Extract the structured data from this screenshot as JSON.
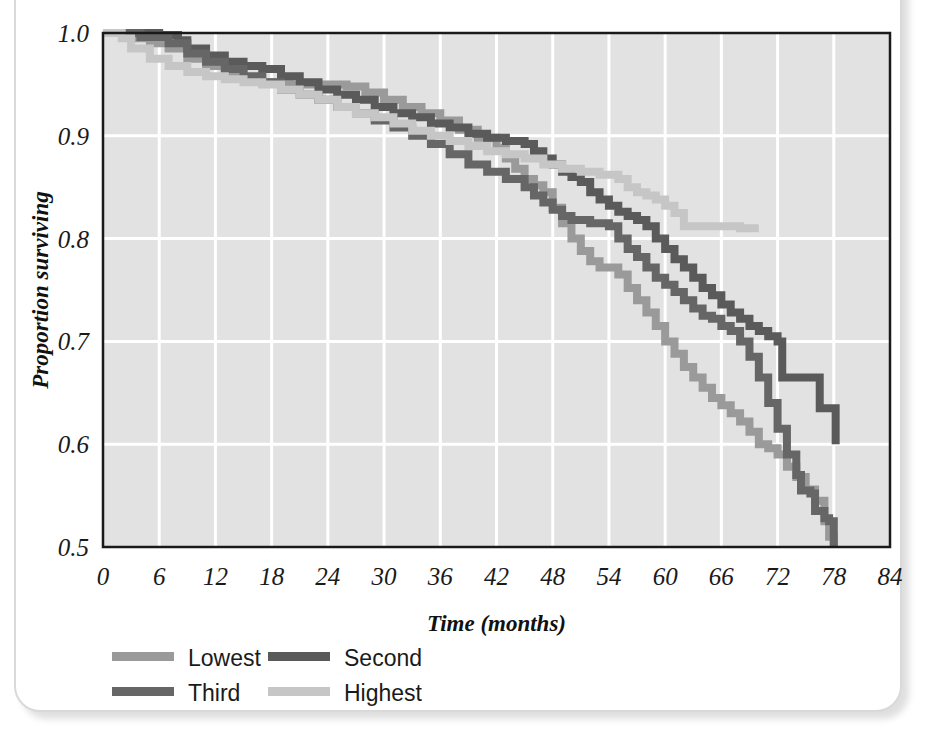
{
  "figure": {
    "cropped_caption_above": "",
    "frame_style": "rounded-box"
  },
  "chart_data": {
    "type": "line",
    "subtype": "kaplan-meier-step",
    "title": "",
    "xlabel": "Time (months)",
    "ylabel": "Proportion surviving",
    "xlim": [
      0,
      84
    ],
    "ylim": [
      0.5,
      1.0
    ],
    "xticks": [
      0,
      6,
      12,
      18,
      24,
      30,
      36,
      42,
      48,
      54,
      60,
      66,
      72,
      78,
      84
    ],
    "yticks": [
      0.5,
      0.6,
      0.7,
      0.8,
      0.9,
      1.0
    ],
    "xtick_labels": [
      "0",
      "6",
      "12",
      "18",
      "24",
      "30",
      "36",
      "42",
      "48",
      "54",
      "60",
      "66",
      "72",
      "78",
      "84"
    ],
    "ytick_labels": [
      "0.5",
      "0.6",
      "0.7",
      "0.8",
      "0.9",
      "1.0"
    ],
    "grid": true,
    "grid_color": "#ffffff",
    "plot_bg": "#e2e2e2",
    "legend_position": "below-axis-left",
    "series": [
      {
        "name": "Lowest",
        "color": "#9a9a9a",
        "points": [
          [
            0,
            1.0
          ],
          [
            3,
            0.995
          ],
          [
            5,
            0.99
          ],
          [
            7,
            0.985
          ],
          [
            9,
            0.975
          ],
          [
            11,
            0.968
          ],
          [
            13,
            0.962
          ],
          [
            15,
            0.956
          ],
          [
            17,
            0.952
          ],
          [
            20,
            0.95
          ],
          [
            23,
            0.95
          ],
          [
            26,
            0.948
          ],
          [
            28,
            0.942
          ],
          [
            30,
            0.935
          ],
          [
            32,
            0.928
          ],
          [
            34,
            0.922
          ],
          [
            36,
            0.915
          ],
          [
            38,
            0.906
          ],
          [
            40,
            0.898
          ],
          [
            42,
            0.888
          ],
          [
            43,
            0.878
          ],
          [
            44,
            0.868
          ],
          [
            45,
            0.858
          ],
          [
            46,
            0.852
          ],
          [
            47,
            0.845
          ],
          [
            48,
            0.83
          ],
          [
            49,
            0.815
          ],
          [
            50,
            0.8
          ],
          [
            51,
            0.788
          ],
          [
            52,
            0.778
          ],
          [
            53,
            0.772
          ],
          [
            55,
            0.765
          ],
          [
            56,
            0.752
          ],
          [
            57,
            0.74
          ],
          [
            58,
            0.728
          ],
          [
            59,
            0.715
          ],
          [
            60,
            0.7
          ],
          [
            61,
            0.688
          ],
          [
            62,
            0.675
          ],
          [
            63,
            0.665
          ],
          [
            64,
            0.655
          ],
          [
            65,
            0.645
          ],
          [
            66,
            0.638
          ],
          [
            67,
            0.63
          ],
          [
            68,
            0.622
          ],
          [
            69,
            0.612
          ],
          [
            70,
            0.6
          ],
          [
            71,
            0.596
          ],
          [
            72,
            0.59
          ],
          [
            73,
            0.578
          ],
          [
            74,
            0.568
          ],
          [
            75,
            0.556
          ],
          [
            76,
            0.545
          ],
          [
            77,
            0.525
          ],
          [
            77.5,
            0.51
          ],
          [
            78,
            0.5
          ]
        ]
      },
      {
        "name": "Second",
        "color": "#5a5a5a",
        "points": [
          [
            0,
            1.0
          ],
          [
            6,
            0.998
          ],
          [
            8,
            0.993
          ],
          [
            9,
            0.985
          ],
          [
            11,
            0.978
          ],
          [
            13,
            0.972
          ],
          [
            15,
            0.968
          ],
          [
            17,
            0.965
          ],
          [
            19,
            0.958
          ],
          [
            21,
            0.952
          ],
          [
            23,
            0.945
          ],
          [
            25,
            0.94
          ],
          [
            27,
            0.935
          ],
          [
            29,
            0.928
          ],
          [
            31,
            0.922
          ],
          [
            33,
            0.918
          ],
          [
            35,
            0.912
          ],
          [
            37,
            0.908
          ],
          [
            39,
            0.902
          ],
          [
            41,
            0.898
          ],
          [
            43,
            0.895
          ],
          [
            45,
            0.892
          ],
          [
            46,
            0.885
          ],
          [
            47,
            0.878
          ],
          [
            48,
            0.872
          ],
          [
            49,
            0.865
          ],
          [
            50,
            0.86
          ],
          [
            51,
            0.855
          ],
          [
            52,
            0.845
          ],
          [
            53,
            0.838
          ],
          [
            54,
            0.832
          ],
          [
            55,
            0.826
          ],
          [
            56,
            0.822
          ],
          [
            57,
            0.818
          ],
          [
            58,
            0.812
          ],
          [
            59,
            0.8
          ],
          [
            60,
            0.79
          ],
          [
            61,
            0.78
          ],
          [
            62,
            0.772
          ],
          [
            63,
            0.762
          ],
          [
            64,
            0.752
          ],
          [
            65,
            0.745
          ],
          [
            66,
            0.736
          ],
          [
            67,
            0.728
          ],
          [
            68,
            0.722
          ],
          [
            69,
            0.715
          ],
          [
            70,
            0.71
          ],
          [
            71,
            0.705
          ],
          [
            72,
            0.7
          ],
          [
            72.5,
            0.665
          ],
          [
            76,
            0.665
          ],
          [
            76.5,
            0.635
          ],
          [
            78,
            0.635
          ],
          [
            78.2,
            0.6
          ]
        ]
      },
      {
        "name": "Third",
        "color": "#666666",
        "points": [
          [
            0,
            1.0
          ],
          [
            4,
            0.996
          ],
          [
            7,
            0.99
          ],
          [
            9,
            0.98
          ],
          [
            11,
            0.972
          ],
          [
            13,
            0.965
          ],
          [
            15,
            0.958
          ],
          [
            17,
            0.952
          ],
          [
            19,
            0.945
          ],
          [
            21,
            0.94
          ],
          [
            23,
            0.935
          ],
          [
            25,
            0.928
          ],
          [
            27,
            0.922
          ],
          [
            29,
            0.915
          ],
          [
            31,
            0.908
          ],
          [
            33,
            0.9
          ],
          [
            35,
            0.892
          ],
          [
            37,
            0.882
          ],
          [
            39,
            0.872
          ],
          [
            41,
            0.865
          ],
          [
            43,
            0.858
          ],
          [
            45,
            0.85
          ],
          [
            46,
            0.842
          ],
          [
            47,
            0.835
          ],
          [
            48,
            0.828
          ],
          [
            49,
            0.822
          ],
          [
            50,
            0.818
          ],
          [
            52,
            0.815
          ],
          [
            54,
            0.812
          ],
          [
            55,
            0.8
          ],
          [
            56,
            0.79
          ],
          [
            57,
            0.782
          ],
          [
            58,
            0.772
          ],
          [
            59,
            0.762
          ],
          [
            60,
            0.755
          ],
          [
            61,
            0.748
          ],
          [
            62,
            0.74
          ],
          [
            63,
            0.732
          ],
          [
            64,
            0.725
          ],
          [
            65,
            0.722
          ],
          [
            66,
            0.715
          ],
          [
            67,
            0.71
          ],
          [
            68,
            0.7
          ],
          [
            69,
            0.685
          ],
          [
            70,
            0.665
          ],
          [
            71,
            0.64
          ],
          [
            72,
            0.615
          ],
          [
            73,
            0.59
          ],
          [
            74,
            0.57
          ],
          [
            74.5,
            0.555
          ],
          [
            75.5,
            0.552
          ],
          [
            76,
            0.535
          ],
          [
            77,
            0.528
          ],
          [
            77.5,
            0.525
          ],
          [
            78,
            0.5
          ]
        ]
      },
      {
        "name": "Highest",
        "color": "#c6c6c6",
        "points": [
          [
            0,
            1.0
          ],
          [
            2,
            0.995
          ],
          [
            3,
            0.985
          ],
          [
            5,
            0.975
          ],
          [
            7,
            0.968
          ],
          [
            9,
            0.962
          ],
          [
            11,
            0.958
          ],
          [
            13,
            0.955
          ],
          [
            15,
            0.952
          ],
          [
            17,
            0.95
          ],
          [
            19,
            0.945
          ],
          [
            21,
            0.94
          ],
          [
            23,
            0.935
          ],
          [
            25,
            0.928
          ],
          [
            27,
            0.922
          ],
          [
            29,
            0.918
          ],
          [
            31,
            0.912
          ],
          [
            33,
            0.905
          ],
          [
            35,
            0.9
          ],
          [
            37,
            0.895
          ],
          [
            39,
            0.89
          ],
          [
            41,
            0.885
          ],
          [
            43,
            0.882
          ],
          [
            45,
            0.878
          ],
          [
            47,
            0.872
          ],
          [
            49,
            0.868
          ],
          [
            51,
            0.865
          ],
          [
            53,
            0.862
          ],
          [
            55,
            0.858
          ],
          [
            56,
            0.85
          ],
          [
            57,
            0.845
          ],
          [
            58,
            0.842
          ],
          [
            59,
            0.838
          ],
          [
            60,
            0.832
          ],
          [
            61,
            0.825
          ],
          [
            62,
            0.812
          ],
          [
            64,
            0.812
          ],
          [
            68,
            0.81
          ],
          [
            70,
            0.81
          ]
        ]
      }
    ]
  },
  "legend": {
    "entries": [
      {
        "label": "Lowest",
        "color": "#9a9a9a"
      },
      {
        "label": "Second",
        "color": "#5a5a5a"
      },
      {
        "label": "Third",
        "color": "#666666"
      },
      {
        "label": "Highest",
        "color": "#c6c6c6"
      }
    ]
  }
}
